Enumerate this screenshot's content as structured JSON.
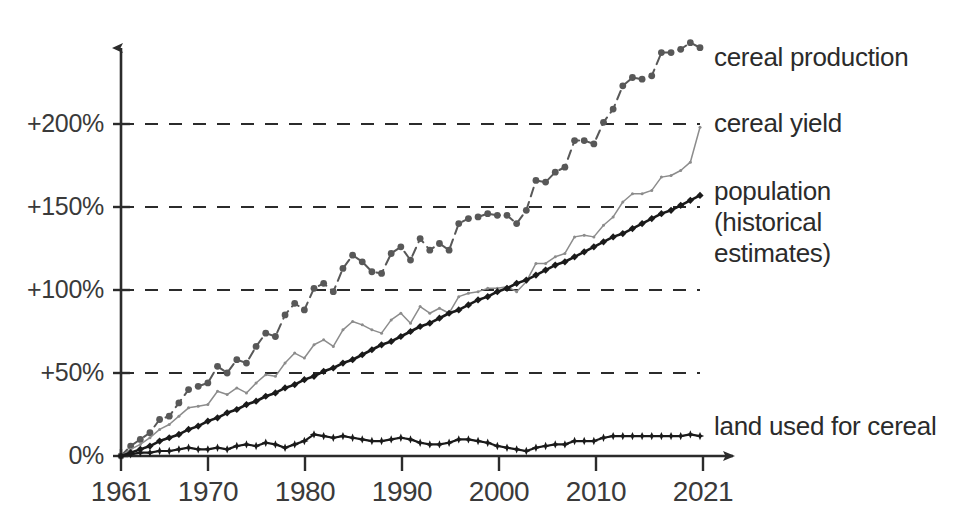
{
  "chart_data": {
    "type": "line",
    "title": "",
    "subtitle": "",
    "xlabel": "",
    "ylabel": "",
    "grid": true,
    "legend_position": "right-inline-labels",
    "xlim": [
      1961,
      2021
    ],
    "ylim": [
      0,
      250
    ],
    "x_ticks": [
      1961,
      1970,
      1980,
      1990,
      2000,
      2010,
      2021
    ],
    "x_tick_labels": [
      "1961",
      "1970",
      "1980",
      "1990",
      "2000",
      "2010",
      "2021"
    ],
    "y_ticks": [
      0,
      50,
      100,
      150,
      200
    ],
    "y_tick_labels": [
      "0%",
      "+50%",
      "+100%",
      "+150%",
      "+200%"
    ],
    "x": [
      1961,
      1962,
      1963,
      1964,
      1965,
      1966,
      1967,
      1968,
      1969,
      1970,
      1971,
      1972,
      1973,
      1974,
      1975,
      1976,
      1977,
      1978,
      1979,
      1980,
      1981,
      1982,
      1983,
      1984,
      1985,
      1986,
      1987,
      1988,
      1989,
      1990,
      1991,
      1992,
      1993,
      1994,
      1995,
      1996,
      1997,
      1998,
      1999,
      2000,
      2001,
      2002,
      2003,
      2004,
      2005,
      2006,
      2007,
      2008,
      2009,
      2010,
      2011,
      2012,
      2013,
      2014,
      2015,
      2016,
      2017,
      2018,
      2019,
      2020,
      2021
    ],
    "series": [
      {
        "name": "cereal production",
        "color": "#585858",
        "style": "dashed",
        "marker": "circle",
        "label": "cereal production",
        "values": [
          0,
          6,
          10,
          14,
          22,
          24,
          32,
          40,
          42,
          44,
          54,
          50,
          58,
          56,
          66,
          74,
          72,
          85,
          92,
          88,
          101,
          104,
          99,
          113,
          121,
          117,
          111,
          110,
          122,
          126,
          118,
          131,
          124,
          128,
          124,
          140,
          143,
          144,
          146,
          145,
          145,
          140,
          148,
          166,
          165,
          171,
          174,
          190,
          190,
          188,
          201,
          209,
          223,
          228,
          227,
          229,
          243,
          243,
          245,
          249,
          246
        ],
        "end_value": 246,
        "end_year": 2021
      },
      {
        "name": "cereal yield",
        "color": "#8c8c8c",
        "style": "solid",
        "marker": "dot",
        "label": "cereal yield",
        "values": [
          0,
          4,
          7,
          11,
          16,
          19,
          24,
          29,
          30,
          31,
          39,
          37,
          41,
          38,
          44,
          49,
          48,
          56,
          62,
          59,
          67,
          70,
          66,
          76,
          81,
          79,
          76,
          74,
          82,
          86,
          80,
          90,
          86,
          89,
          86,
          96,
          98,
          99,
          101,
          101,
          102,
          99,
          105,
          116,
          116,
          120,
          122,
          132,
          133,
          132,
          139,
          144,
          153,
          158,
          158,
          160,
          168,
          169,
          172,
          177,
          198
        ],
        "end_value": 198,
        "end_year": 2021
      },
      {
        "name": "population (historical estimates)",
        "color": "#1a1a1a",
        "style": "solid",
        "marker": "diamond",
        "label": "population\n(historical\nestimates)",
        "label_lines": [
          "population",
          "(historical",
          "estimates)"
        ],
        "values": [
          0,
          2,
          4,
          6,
          9,
          11,
          13,
          16,
          18,
          21,
          23,
          26,
          28,
          31,
          33,
          36,
          38,
          41,
          43,
          46,
          48,
          51,
          53,
          56,
          58,
          61,
          64,
          67,
          69,
          72,
          75,
          78,
          80,
          83,
          86,
          88,
          91,
          94,
          96,
          99,
          101,
          104,
          106,
          109,
          112,
          115,
          117,
          120,
          123,
          126,
          129,
          132,
          134,
          137,
          140,
          143,
          146,
          148,
          151,
          154,
          157
        ],
        "end_value": 157,
        "end_year": 2021
      },
      {
        "name": "land used for cereal",
        "color": "#1a1a1a",
        "style": "solid",
        "marker": "star",
        "label": "land used for cereal",
        "values": [
          0,
          1,
          2,
          2,
          3,
          3,
          4,
          5,
          4,
          4,
          5,
          4,
          6,
          7,
          6,
          8,
          7,
          5,
          7,
          9,
          13,
          12,
          11,
          12,
          11,
          10,
          9,
          9,
          10,
          11,
          10,
          8,
          7,
          7,
          8,
          10,
          10,
          9,
          8,
          6,
          5,
          4,
          3,
          5,
          6,
          7,
          7,
          9,
          9,
          9,
          11,
          12,
          12,
          12,
          12,
          12,
          12,
          12,
          12,
          13,
          12
        ],
        "end_value": 12,
        "end_year": 2021
      }
    ]
  },
  "axes": {
    "y_axis_name": "percent-change-axis",
    "x_axis_name": "year-axis",
    "y_labels": [
      "+200%",
      "+150%",
      "+100%",
      "+50%",
      "0%"
    ],
    "x_labels": [
      "1961",
      "1970",
      "1980",
      "1990",
      "2000",
      "2010",
      "2021"
    ]
  },
  "labels": {
    "cereal_production": "cereal production",
    "cereal_yield": "cereal yield",
    "population_line1": "population",
    "population_line2": "(historical",
    "population_line3": "estimates)",
    "land_used": "land used for cereal"
  },
  "colors": {
    "production": "#585858",
    "yield": "#8c8c8c",
    "population": "#1a1a1a",
    "land": "#1a1a1a",
    "grid": "#2b2b2b",
    "axis": "#3a3a3a",
    "text": "#2b2b2b",
    "background": "#ffffff"
  }
}
